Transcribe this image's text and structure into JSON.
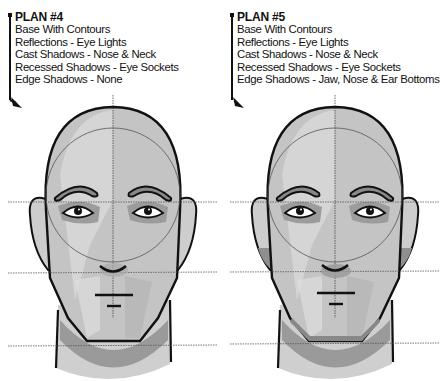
{
  "plans": [
    {
      "title": "PLAN #4",
      "steps": [
        "Base With Contours",
        "Reflections - Eye Lights",
        "Cast Shadows - Nose & Neck",
        "Recessed Shadows - Eye Sockets",
        "Edge Shadows - None"
      ],
      "figure": "head-front-view-shading-plan-4"
    },
    {
      "title": "PLAN #5",
      "steps": [
        "Base With Contours",
        "Reflections - Eye Lights",
        "Cast Shadows - Nose & Neck",
        "Recessed Shadows - Eye Sockets",
        "Edge Shadows - Jaw, Nose & Ear Bottoms"
      ],
      "figure": "head-front-view-shading-plan-5"
    }
  ],
  "colors": {
    "ink": "#111111",
    "skin_light": "#d9d9d9",
    "skin_mid": "#bdbdbd",
    "skin_shadow": "#9e9e9e",
    "guide_line": "#555555"
  }
}
